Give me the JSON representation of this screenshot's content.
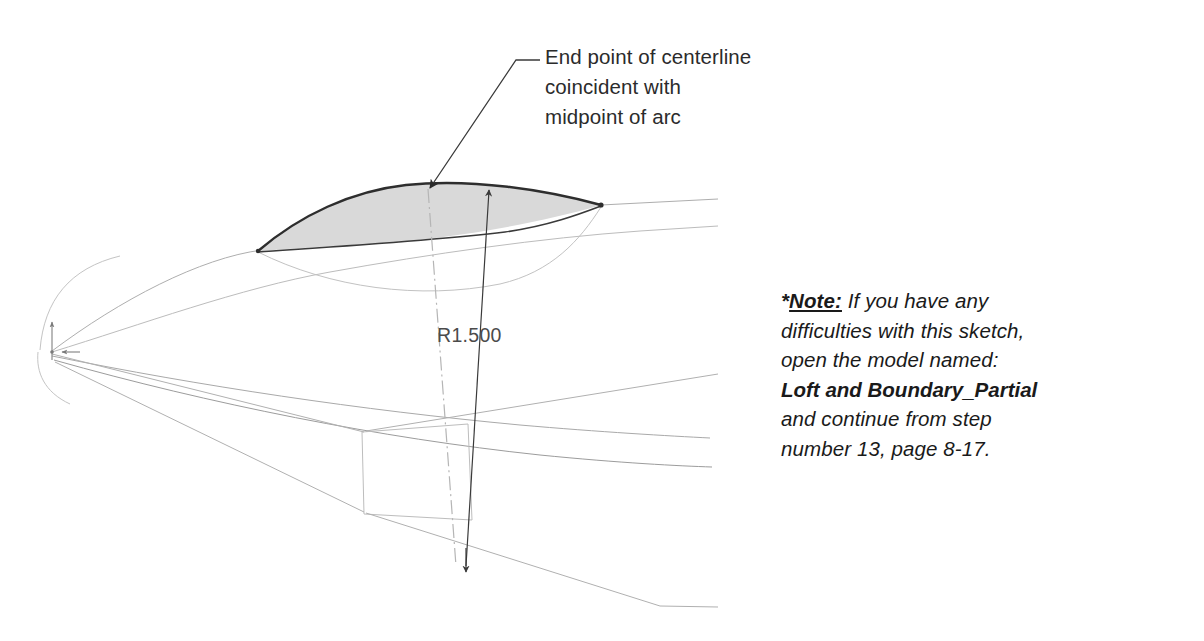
{
  "figure": {
    "background_color": "#ffffff"
  },
  "callout": {
    "id": "end-point-callout",
    "text": "End point of centerline\ncoincident with\nmidpoint of arc",
    "lines": [
      "End point of centerline",
      "coincident with",
      "midpoint of arc"
    ],
    "leader": {
      "shoulder_start": [
        540,
        60
      ],
      "shoulder_end": [
        516,
        60
      ],
      "elbow": [
        516,
        60
      ],
      "tip": [
        428,
        189
      ],
      "arrowhead": "filled-triangle"
    },
    "text_color": "#2b2b2b"
  },
  "dimension": {
    "id": "radius-dimension",
    "label": "R1.500",
    "label_color": "#4b4b4b",
    "leader": {
      "from": [
        489,
        186
      ],
      "to": [
        466,
        570
      ],
      "arrow_top": "filled-triangle-up",
      "arrow_bottom": "filled-triangle-down"
    }
  },
  "centerline": {
    "id": "sketch-centerline",
    "style": "dash-dot",
    "from": [
      428,
      190
    ],
    "to": [
      455,
      565
    ],
    "color": "#b8b8b8"
  },
  "origin": {
    "id": "sketch-origin",
    "position": [
      52,
      352
    ],
    "x_axis_arrow": [
      78,
      352
    ],
    "y_axis_arrow": [
      52,
      322
    ],
    "color": "#8c8c8c"
  },
  "surface": {
    "id": "loft-surface",
    "fill_color": "#d9d9d9",
    "stroke_color": "#333333",
    "left_vertex": [
      258,
      251
    ],
    "right_vertex": [
      601,
      205
    ],
    "apex": [
      430,
      186
    ]
  },
  "note": {
    "id": "model-note",
    "star": "*",
    "heading": "Note:",
    "lines": [
      "If you have any",
      "difficulties with this sketch,",
      "open the model named:",
      "Loft and Boundary_Partial",
      "and continue from step",
      "number 13, page 8-17."
    ],
    "model_name": "Loft and Boundary_Partial",
    "step_number": "13",
    "page_reference": "8-17",
    "text_color": "#1a1a1a"
  },
  "colors": {
    "wire_light": "#b4b4b4",
    "wire_mid": "#9a9a9a",
    "wire_dark": "#6e6e6e",
    "outline": "#333333",
    "fill_gray": "#d9d9d9",
    "text": "#231f20"
  }
}
